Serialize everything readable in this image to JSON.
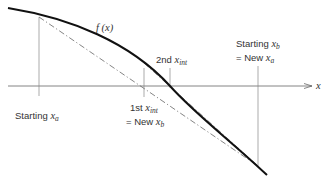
{
  "diagram": {
    "type": "false-position-method",
    "function_label": "f (x)",
    "axis_label": "x",
    "labels": {
      "starting_xa": {
        "prefix": "Starting ",
        "var": "x",
        "sub": "a"
      },
      "first_xint": {
        "prefix": "1st  ",
        "var": "x",
        "sub": "int"
      },
      "first_new_xb": {
        "prefix": "= New ",
        "var": "x",
        "sub": "b"
      },
      "second_xint": {
        "prefix": "2nd  ",
        "var": "x",
        "sub": "int"
      },
      "starting_xb": {
        "prefix": "Starting ",
        "var": "x",
        "sub": "b"
      },
      "new_xa": {
        "prefix": "= New ",
        "var": "x",
        "sub": "a"
      }
    },
    "colors": {
      "curve": "#111111",
      "axis": "#555555",
      "guides": "#777777",
      "chords": "#666666"
    }
  }
}
